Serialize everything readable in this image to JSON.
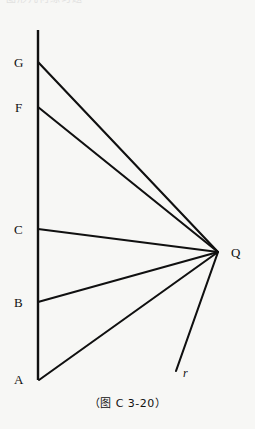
{
  "figure": {
    "cropped_header_text": "图形几何练习题",
    "caption": "（图 C 3-20）",
    "background_color": "#f7f7f5",
    "stroke_color": "#101010",
    "vertices": [
      {
        "name": "G",
        "label": "G",
        "x": 38,
        "y": 62,
        "label_x": 14,
        "label_y": 56
      },
      {
        "name": "F",
        "label": "F",
        "x": 38,
        "y": 107,
        "label_x": 15,
        "label_y": 101
      },
      {
        "name": "C",
        "label": "C",
        "x": 38,
        "y": 229,
        "label_x": 14,
        "label_y": 223
      },
      {
        "name": "B",
        "label": "B",
        "x": 38,
        "y": 302,
        "label_x": 14,
        "label_y": 296
      },
      {
        "name": "A",
        "label": "A",
        "x": 39,
        "y": 380,
        "label_x": 14,
        "label_y": 373
      },
      {
        "name": "Q",
        "label": "Q",
        "x": 218,
        "y": 252,
        "label_x": 231,
        "label_y": 246
      }
    ],
    "ray": {
      "name": "r",
      "label": "r",
      "from_x": 218,
      "from_y": 252,
      "to_x": 176,
      "to_y": 371,
      "label_x": 183,
      "label_y": 367
    },
    "vertical_line": {
      "x": 38,
      "top_y": 30,
      "bottom_y": 380
    },
    "segments_to_q": [
      "G",
      "F",
      "C",
      "B",
      "A"
    ]
  }
}
